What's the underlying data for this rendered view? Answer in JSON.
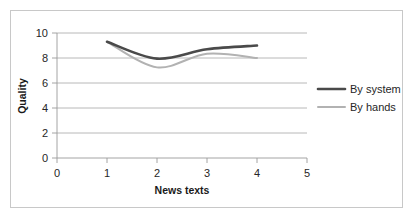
{
  "chart_data": {
    "type": "line",
    "title": "",
    "xlabel": "News texts",
    "ylabel": "Quality",
    "xlim": [
      0,
      5
    ],
    "ylim": [
      0,
      10
    ],
    "x": [
      1,
      2,
      3,
      4
    ],
    "xticks": [
      "0",
      "1",
      "2",
      "3",
      "4",
      "5"
    ],
    "yticks": [
      "0",
      "2",
      "4",
      "6",
      "8",
      "10"
    ],
    "grid": "horizontal",
    "legend_position": "right",
    "smoothed": true,
    "series": [
      {
        "name": "By system",
        "values": [
          9.3,
          7.95,
          8.7,
          9.0
        ],
        "color": "#4a4a4a",
        "width": 2.6
      },
      {
        "name": "By hands",
        "values": [
          9.3,
          7.25,
          8.35,
          8.0
        ],
        "color": "#b2b2b2",
        "width": 2.0
      }
    ]
  },
  "axes": {
    "y_title": "Quality",
    "x_title": "News texts",
    "y_tick_0": "0",
    "y_tick_2": "2",
    "y_tick_4": "4",
    "y_tick_6": "6",
    "y_tick_8": "8",
    "y_tick_10": "10",
    "x_tick_0": "0",
    "x_tick_1": "1",
    "x_tick_2": "2",
    "x_tick_3": "3",
    "x_tick_4": "4",
    "x_tick_5": "5"
  },
  "legend": {
    "items": [
      {
        "label": "By system",
        "color": "#4a4a4a"
      },
      {
        "label": "By hands",
        "color": "#b2b2b2"
      }
    ]
  },
  "colors": {
    "by_system": "#4a4a4a",
    "by_hands": "#b2b2b2",
    "gridline": "#a6a6a6",
    "border": "#c8c8c8",
    "text": "#262626",
    "background": "#ffffff"
  }
}
